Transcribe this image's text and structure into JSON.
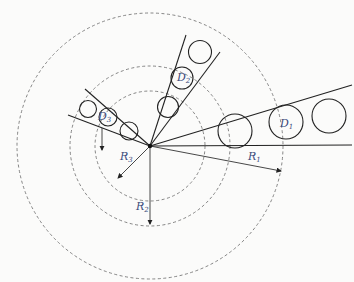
{
  "diagram": {
    "title": "",
    "center": {
      "x": 150,
      "y": 146
    },
    "colors": {
      "background": "#fbfbfa",
      "line": "#222222",
      "dashed": "#777777",
      "label": "#3a4a7a"
    },
    "rings": [
      {
        "id": "R1",
        "radius": 133
      },
      {
        "id": "R2",
        "radius": 80
      },
      {
        "id": "R3",
        "radius": 55
      }
    ],
    "labels": {
      "D1": {
        "main": "D",
        "sub": "1"
      },
      "D2": {
        "main": "D",
        "sub": "2"
      },
      "D3p": {
        "main": "D",
        "sub": "3",
        "prime": "′"
      },
      "R1": {
        "main": "R",
        "sub": "1"
      },
      "R2": {
        "main": "R",
        "sub": "2"
      },
      "R3": {
        "main": "R",
        "sub": "3"
      }
    }
  }
}
